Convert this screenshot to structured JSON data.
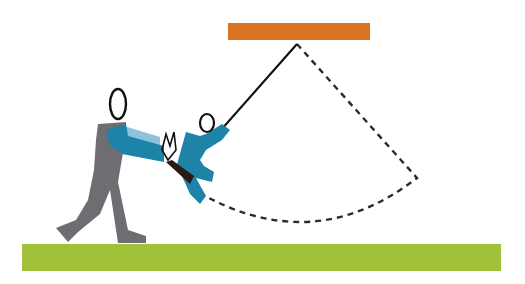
{
  "figure": {
    "colors": {
      "beam": "#d9731f",
      "ground": "#a2c13a",
      "adult_body": "#6f6d72",
      "shirt": "#1d84a8",
      "shirt_light": "#8fc3dd",
      "line": "#111111",
      "seat": "#2a1a16"
    },
    "elements": {
      "beam": "swing-beam",
      "rope": "swing-rope",
      "arc": "swing-path-arc",
      "ground": "ground",
      "adult": "adult-pusher",
      "child": "child-on-swing"
    }
  }
}
